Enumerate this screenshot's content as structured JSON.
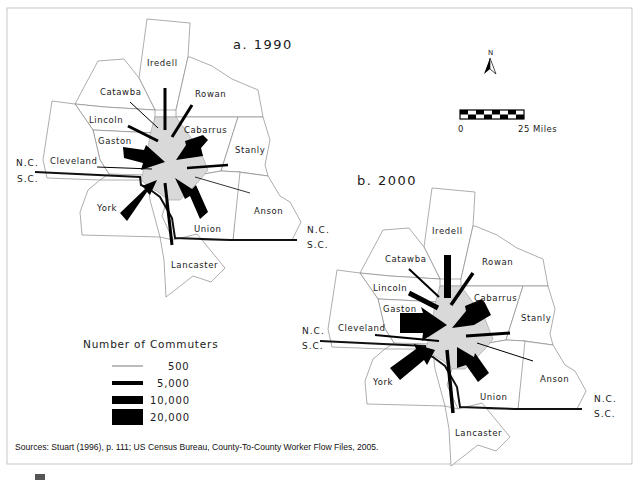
{
  "figure": {
    "panels": [
      {
        "id": "1990",
        "title": "a. 1990"
      },
      {
        "id": "2000",
        "title": "b. 2000"
      }
    ],
    "counties": [
      "Iredell",
      "Catawba",
      "Rowan",
      "Lincoln",
      "Cabarrus",
      "Gaston",
      "Stanly",
      "Cleveland",
      "York",
      "Anson",
      "Union",
      "Lancaster"
    ],
    "labels": {
      "iredell": "Iredell",
      "catawba": "Catawba",
      "rowan": "Rowan",
      "lincoln": "Lincoln",
      "cabarrus": "Cabarrus",
      "gaston": "Gaston",
      "stanly": "Stanly",
      "cleveland": "Cleveland",
      "york": "York",
      "anson": "Anson",
      "union": "Union",
      "lancaster": "Lancaster"
    },
    "state_labels": {
      "nc": "N.C.",
      "sc": "S.C."
    },
    "north_arrow": {
      "label": "N",
      "icon": "north-arrow-icon"
    },
    "scale_bar": {
      "start": "0",
      "end": "25 Miles"
    },
    "legend": {
      "title": "Number of Commuters",
      "items": [
        {
          "value": "500",
          "thickness": 1
        },
        {
          "value": "5,000",
          "thickness": 4
        },
        {
          "value": "10,000",
          "thickness": 8
        },
        {
          "value": "20,000",
          "thickness": 16
        }
      ]
    },
    "source": "Sources: Stuart (1996), p. 111; US Census Bureau, County-To-County Worker Flow Files, 2005.",
    "colors": {
      "flow": "#000000",
      "core_county": "#d9d9d9",
      "boundary": "#8a8a8a",
      "background": "#ffffff"
    }
  }
}
